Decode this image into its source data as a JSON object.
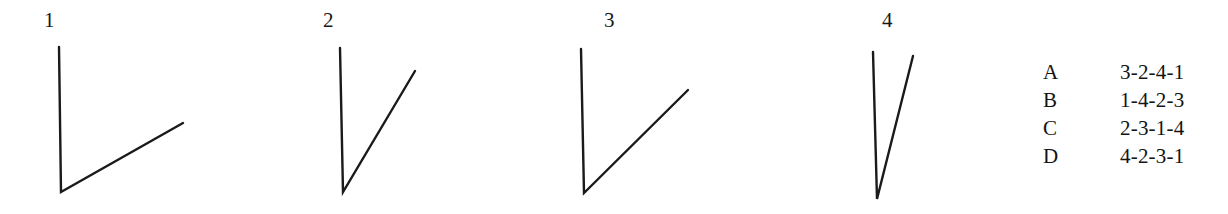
{
  "page": {
    "background_color": "#ffffff",
    "ink_color": "#1a1a1a",
    "type": "multiple-choice-figure-question",
    "prompt_implied": "Rank the four angles"
  },
  "figures": [
    {
      "label": "1",
      "label_x": 44,
      "label_y": 10,
      "vertex": {
        "x": 61,
        "y": 192
      },
      "ray_left_end": {
        "x": 59,
        "y": 47
      },
      "ray_right_end": {
        "x": 183,
        "y": 123
      },
      "angle_degrees": 31,
      "stroke_width": 2.4
    },
    {
      "label": "2",
      "label_x": 323,
      "label_y": 10,
      "vertex": {
        "x": 343,
        "y": 192
      },
      "ray_left_end": {
        "x": 340,
        "y": 48
      },
      "ray_right_end": {
        "x": 415,
        "y": 71
      },
      "angle_degrees": 29,
      "stroke_width": 2.4
    },
    {
      "label": "3",
      "label_x": 604,
      "label_y": 10,
      "vertex": {
        "x": 584,
        "y": 193
      },
      "ray_left_end": {
        "x": 581,
        "y": 49
      },
      "ray_right_end": {
        "x": 688,
        "y": 90
      },
      "angle_degrees": 45,
      "stroke_width": 2.4
    },
    {
      "label": "4",
      "label_x": 882,
      "label_y": 10,
      "vertex": {
        "x": 877,
        "y": 199
      },
      "ray_left_end": {
        "x": 873,
        "y": 52
      },
      "ray_right_end": {
        "x": 913,
        "y": 56
      },
      "angle_degrees": 14,
      "stroke_width": 2.4
    }
  ],
  "options": [
    {
      "letter": "A",
      "sequence": "3-2-4-1",
      "y": 3
    },
    {
      "letter": "B",
      "sequence": "1-4-2-3",
      "y": 31
    },
    {
      "letter": "C",
      "sequence": "2-3-1-4",
      "y": 59
    },
    {
      "letter": "D",
      "sequence": "4-2-3-1",
      "y": 87
    }
  ]
}
